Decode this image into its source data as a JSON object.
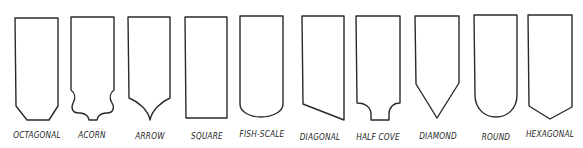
{
  "diagram": {
    "type": "shingle-shapes",
    "stroke_color": "#2a2a2a",
    "background": "#ffffff",
    "shapes": [
      {
        "id": "octagonal",
        "label": "OCTAGONAL",
        "cx": 36,
        "label_y": 134
      },
      {
        "id": "acorn",
        "label": "ACORN",
        "cx": 92,
        "label_y": 134
      },
      {
        "id": "arrow",
        "label": "ARROW",
        "cx": 150,
        "label_y": 135
      },
      {
        "id": "square",
        "label": "SQUARE",
        "cx": 206,
        "label_y": 135
      },
      {
        "id": "fish-scale",
        "label": "FISH-SCALE",
        "cx": 261,
        "label_y": 133
      },
      {
        "id": "diagonal",
        "label": "DIAGONAL",
        "cx": 319,
        "label_y": 136
      },
      {
        "id": "half-cove",
        "label": "HALF COVE",
        "cx": 378,
        "label_y": 136
      },
      {
        "id": "diamond",
        "label": "DIAMOND",
        "cx": 438,
        "label_y": 135
      },
      {
        "id": "round",
        "label": "ROUND",
        "cx": 496,
        "label_y": 136
      },
      {
        "id": "hexagonal",
        "label": "HEXAGONAL",
        "cx": 550,
        "label_y": 133
      }
    ]
  }
}
